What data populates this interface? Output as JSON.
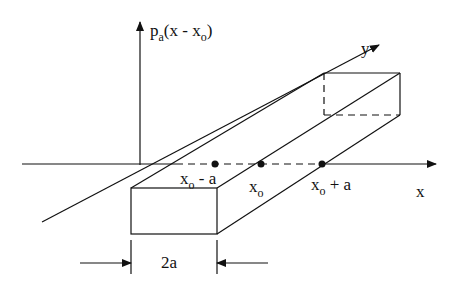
{
  "diagram": {
    "vertical_axis_label": {
      "main": "p",
      "sub": "a",
      "rest": "(x - x",
      "sub2": "o",
      "close": ")"
    },
    "y_axis_label": "y",
    "x_axis_label": "x",
    "points": [
      {
        "main": "x",
        "sub": "o",
        "suffix": " - a"
      },
      {
        "main": "x",
        "sub": "o",
        "suffix": ""
      },
      {
        "main": "x",
        "sub": "o",
        "suffix": " + a"
      }
    ],
    "width_label": "2a",
    "colors": {
      "line": "#111111",
      "background": "#ffffff"
    }
  }
}
